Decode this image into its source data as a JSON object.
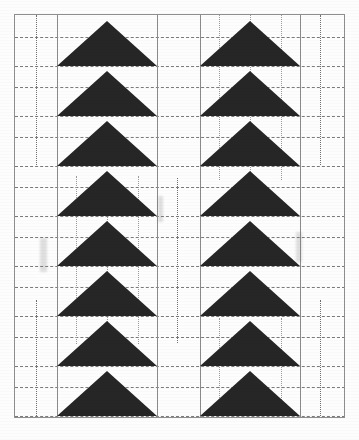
{
  "document": {
    "title": "Scanned line-art pattern sheet",
    "description": "Two vertical columns of solid black upward-pointing triangles over a dotted construction grid",
    "background_color": "#ffffff",
    "ink_color": "#262626",
    "frame_color": "#8e8e8e",
    "guide_color": "#7b7b7b",
    "width": 359,
    "height": 440
  },
  "frame": {
    "x": 14,
    "y": 14,
    "width": 331,
    "height": 404
  },
  "columns": [
    {
      "name": "left-column",
      "x": 57,
      "width": 100,
      "top": 16,
      "triangle_count": 8,
      "cell_height": 50,
      "triangle_height": 45
    },
    {
      "name": "right-column",
      "x": 200,
      "width": 100,
      "top": 16,
      "triangle_count": 8,
      "cell_height": 50,
      "triangle_height": 45
    }
  ],
  "vertical_rules": [
    {
      "name": "left-column-left-edge",
      "x": 57,
      "y": 15,
      "height": 403
    },
    {
      "name": "left-column-right-edge",
      "x": 157,
      "y": 15,
      "height": 403
    },
    {
      "name": "right-column-left-edge",
      "x": 200,
      "y": 15,
      "height": 403
    },
    {
      "name": "right-column-right-edge",
      "x": 300,
      "y": 15,
      "height": 403
    }
  ],
  "vertical_guides": [
    {
      "name": "left-margin-guide-upper",
      "x": 36,
      "y": 15,
      "height": 150,
      "weight": "bold"
    },
    {
      "name": "left-margin-guide-lower",
      "x": 36,
      "y": 300,
      "height": 118,
      "weight": "bold"
    },
    {
      "name": "center-gap-guide",
      "x": 177,
      "y": 178,
      "height": 165,
      "weight": "bold"
    },
    {
      "name": "right-margin-guide-upper",
      "x": 320,
      "y": 15,
      "height": 150,
      "weight": "bold"
    },
    {
      "name": "right-margin-guide-lower",
      "x": 320,
      "y": 300,
      "height": 118,
      "weight": "bold"
    },
    {
      "name": "left-col-guide-a",
      "x": 76,
      "y": 176,
      "height": 168,
      "weight": "fine"
    },
    {
      "name": "left-col-guide-b",
      "x": 107,
      "y": 176,
      "height": 168,
      "weight": "fine"
    },
    {
      "name": "left-col-guide-c",
      "x": 138,
      "y": 176,
      "height": 168,
      "weight": "fine"
    },
    {
      "name": "right-col-guide-a",
      "x": 219,
      "y": 15,
      "height": 165,
      "weight": "fine"
    },
    {
      "name": "right-col-guide-b",
      "x": 250,
      "y": 15,
      "height": 165,
      "weight": "fine"
    },
    {
      "name": "right-col-guide-c",
      "x": 281,
      "y": 15,
      "height": 165,
      "weight": "fine"
    },
    {
      "name": "right-col-guide-d",
      "x": 219,
      "y": 318,
      "height": 100,
      "weight": "fine"
    },
    {
      "name": "right-col-guide-e",
      "x": 281,
      "y": 318,
      "height": 100,
      "weight": "fine"
    }
  ],
  "horizontal_guides": [
    {
      "name": "guide-row-1",
      "y": 37,
      "x": 15,
      "width": 330
    },
    {
      "name": "guide-row-2",
      "y": 66,
      "x": 15,
      "width": 330
    },
    {
      "name": "guide-row-3",
      "y": 87,
      "x": 15,
      "width": 330
    },
    {
      "name": "guide-row-4",
      "y": 116,
      "x": 15,
      "width": 330
    },
    {
      "name": "guide-row-5",
      "y": 137,
      "x": 15,
      "width": 330
    },
    {
      "name": "guide-row-6",
      "y": 166,
      "x": 15,
      "width": 330
    },
    {
      "name": "guide-row-7",
      "y": 187,
      "x": 15,
      "width": 330
    },
    {
      "name": "guide-row-8",
      "y": 216,
      "x": 15,
      "width": 330
    },
    {
      "name": "guide-row-9",
      "y": 237,
      "x": 15,
      "width": 330
    },
    {
      "name": "guide-row-10",
      "y": 266,
      "x": 15,
      "width": 330
    },
    {
      "name": "guide-row-11",
      "y": 287,
      "x": 15,
      "width": 330
    },
    {
      "name": "guide-row-12",
      "y": 316,
      "x": 15,
      "width": 330
    },
    {
      "name": "guide-row-13",
      "y": 337,
      "x": 15,
      "width": 330
    },
    {
      "name": "guide-row-14",
      "y": 366,
      "x": 15,
      "width": 330
    },
    {
      "name": "guide-row-15",
      "y": 387,
      "x": 15,
      "width": 330
    },
    {
      "name": "guide-row-16",
      "y": 416,
      "x": 15,
      "width": 330
    }
  ]
}
